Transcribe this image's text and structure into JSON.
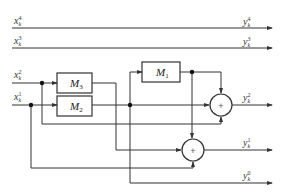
{
  "diagram": {
    "type": "block-diagram",
    "inputs": [
      {
        "id": "x4",
        "base": "x",
        "sub": "k",
        "sup": "4"
      },
      {
        "id": "x3",
        "base": "x",
        "sub": "k",
        "sup": "3"
      },
      {
        "id": "x2",
        "base": "x",
        "sub": "k",
        "sup": "2"
      },
      {
        "id": "x1",
        "base": "x",
        "sub": "k",
        "sup": "1"
      }
    ],
    "outputs": [
      {
        "id": "y4",
        "base": "y",
        "sub": "k",
        "sup": "4"
      },
      {
        "id": "y3",
        "base": "y",
        "sub": "k",
        "sup": "3"
      },
      {
        "id": "y2",
        "base": "y",
        "sub": "k",
        "sup": "2"
      },
      {
        "id": "y1",
        "base": "y",
        "sub": "k",
        "sup": "1"
      },
      {
        "id": "y0",
        "base": "y",
        "sub": "k",
        "sup": "0"
      }
    ],
    "blocks": [
      {
        "id": "M3",
        "base": "M",
        "sub": "3"
      },
      {
        "id": "M2",
        "base": "M",
        "sub": "2"
      },
      {
        "id": "M1",
        "base": "M",
        "sub": "1"
      }
    ],
    "adders": [
      {
        "id": "sum-upper",
        "symbol": "+"
      },
      {
        "id": "sum-lower",
        "symbol": "+"
      }
    ],
    "colors": {
      "line": "#333333",
      "background": "#ffffff"
    }
  }
}
